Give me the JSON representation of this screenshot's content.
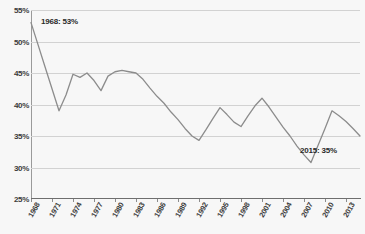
{
  "chart_data": {
    "type": "line",
    "title": "",
    "xlabel": "",
    "ylabel": "",
    "ylim": [
      25,
      55
    ],
    "ytick_labels": [
      "55%",
      "50%",
      "45%",
      "40%",
      "35%",
      "30%",
      "25%"
    ],
    "ytick_values": [
      55,
      50,
      45,
      40,
      35,
      30,
      25
    ],
    "xlim": [
      1968,
      2015
    ],
    "xtick_labels": [
      "1968",
      "1971",
      "1974",
      "1977",
      "1980",
      "1983",
      "1986",
      "1989",
      "1992",
      "1995",
      "1998",
      "2001",
      "2004",
      "2007",
      "2010",
      "2013"
    ],
    "xtick_values": [
      1968,
      1971,
      1974,
      1977,
      1980,
      1983,
      1986,
      1989,
      1992,
      1995,
      1998,
      2001,
      2004,
      2007,
      2010,
      2013
    ],
    "grid": true,
    "legend": "none",
    "line_color": "#8c8c8c",
    "background_color": "#f7f7f7",
    "x": [
      1968,
      1969,
      1970,
      1971,
      1972,
      1973,
      1974,
      1975,
      1976,
      1977,
      1978,
      1979,
      1980,
      1981,
      1982,
      1983,
      1984,
      1985,
      1986,
      1987,
      1988,
      1989,
      1990,
      1991,
      1992,
      1993,
      1994,
      1995,
      1996,
      1997,
      1998,
      1999,
      2000,
      2001,
      2002,
      2003,
      2004,
      2005,
      2006,
      2007,
      2008,
      2009,
      2010,
      2011,
      2012,
      2013,
      2014,
      2015
    ],
    "values": [
      53.0,
      49.5,
      46.0,
      42.5,
      39.0,
      41.5,
      44.8,
      44.3,
      45.0,
      43.8,
      42.2,
      44.5,
      45.2,
      45.4,
      45.2,
      45.0,
      44.0,
      42.6,
      41.3,
      40.2,
      38.8,
      37.6,
      36.2,
      35.0,
      34.3,
      36.0,
      37.8,
      39.5,
      38.4,
      37.2,
      36.5,
      38.2,
      39.8,
      41.0,
      39.6,
      38.0,
      36.4,
      35.0,
      33.4,
      32.0,
      30.8,
      33.5,
      36.2,
      39.0,
      38.2,
      37.3,
      36.2,
      35.0
    ],
    "annotations": [
      {
        "id": "start",
        "label": "1968: 53%",
        "year": 1968,
        "value": 53
      },
      {
        "id": "end",
        "label": "2015: 35%",
        "year": 2015,
        "value": 35
      }
    ]
  }
}
